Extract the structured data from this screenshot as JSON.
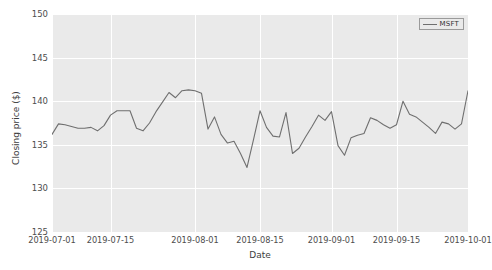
{
  "chart_data": {
    "type": "line",
    "title": "",
    "xlabel": "Date",
    "ylabel": "Closing price ($)",
    "ylim": [
      125,
      150
    ],
    "yticks": [
      125,
      130,
      135,
      140,
      145,
      150
    ],
    "xticks": [
      "2019-07-01",
      "2019-07-15",
      "2019-08-01",
      "2019-08-15",
      "2019-09-01",
      "2019-09-15",
      "2019-10-01"
    ],
    "grid": true,
    "legend_position": "upper right",
    "line_color": "#6f6f6f",
    "plot_background": "#eaeaea",
    "gridline_color": "#ffffff",
    "series": [
      {
        "name": "MSFT",
        "x": [
          "2019-07-01",
          "2019-07-02",
          "2019-07-03",
          "2019-07-05",
          "2019-07-08",
          "2019-07-09",
          "2019-07-10",
          "2019-07-11",
          "2019-07-12",
          "2019-07-15",
          "2019-07-16",
          "2019-07-17",
          "2019-07-18",
          "2019-07-19",
          "2019-07-22",
          "2019-07-23",
          "2019-07-24",
          "2019-07-25",
          "2019-07-26",
          "2019-07-29",
          "2019-07-30",
          "2019-07-31",
          "2019-08-01",
          "2019-08-02",
          "2019-08-05",
          "2019-08-06",
          "2019-08-07",
          "2019-08-08",
          "2019-08-09",
          "2019-08-12",
          "2019-08-13",
          "2019-08-14",
          "2019-08-15",
          "2019-08-16",
          "2019-08-19",
          "2019-08-20",
          "2019-08-21",
          "2019-08-22",
          "2019-08-23",
          "2019-08-26",
          "2019-08-27",
          "2019-08-28",
          "2019-08-29",
          "2019-08-30",
          "2019-09-03",
          "2019-09-04",
          "2019-09-05",
          "2019-09-06",
          "2019-09-09",
          "2019-09-10",
          "2019-09-11",
          "2019-09-12",
          "2019-09-13",
          "2019-09-16",
          "2019-09-17",
          "2019-09-18",
          "2019-09-19",
          "2019-09-20",
          "2019-09-23",
          "2019-09-24",
          "2019-09-25",
          "2019-09-26",
          "2019-09-27",
          "2019-09-30",
          "2019-10-01"
        ],
        "values": [
          136.2,
          137.4,
          137.3,
          137.1,
          136.9,
          136.9,
          137.0,
          136.6,
          137.2,
          138.4,
          138.9,
          138.9,
          138.9,
          136.9,
          136.6,
          137.5,
          138.8,
          139.9,
          141.0,
          140.4,
          141.2,
          141.3,
          141.2,
          140.9,
          136.8,
          138.2,
          136.2,
          135.2,
          135.4,
          134.0,
          132.4,
          135.6,
          138.9,
          137.0,
          136.0,
          135.9,
          138.7,
          134.0,
          134.6,
          135.9,
          137.1,
          138.4,
          137.8,
          138.8,
          134.9,
          133.8,
          135.8,
          136.1,
          136.3,
          138.1,
          137.8,
          137.3,
          136.9,
          137.3,
          140.0,
          138.5,
          138.2,
          137.6,
          137.0,
          136.3,
          137.6,
          137.4,
          136.8,
          137.4,
          141.2
        ]
      }
    ],
    "extra_values_note": ""
  },
  "legend": {
    "label": "MSFT"
  },
  "axes": {
    "ylabel": "Closing price ($)",
    "xlabel": "Date"
  }
}
